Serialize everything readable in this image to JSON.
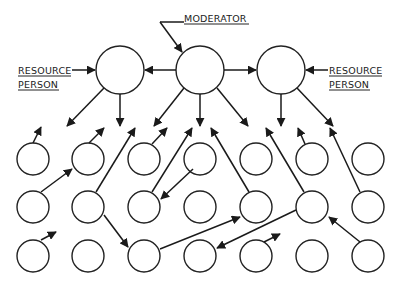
{
  "labels": {
    "moderator": "MODERATOR",
    "resource_left_line1": "RESOURCE",
    "resource_left_line2": "PERSON",
    "resource_right_line1": "RESOURCE",
    "resource_right_line2": "PERSON"
  },
  "colors": {
    "stroke": "#1a1a1a",
    "background": "#ffffff"
  },
  "top_nodes": [
    {
      "id": "resource-left",
      "role": "resource person",
      "cx": 120,
      "cy": 70,
      "r": 24
    },
    {
      "id": "moderator",
      "role": "moderator",
      "cx": 200,
      "cy": 70,
      "r": 24
    },
    {
      "id": "resource-right",
      "role": "resource person",
      "cx": 281,
      "cy": 70,
      "r": 24
    }
  ],
  "grid": {
    "columns_x": [
      33,
      88,
      144,
      200,
      256,
      312,
      368
    ],
    "rows_y": [
      159,
      207,
      256
    ],
    "r": 16
  }
}
